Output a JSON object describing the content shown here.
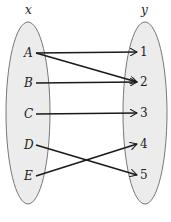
{
  "diagram": {
    "type": "mapping",
    "domain_label": "x",
    "codomain_label": "y",
    "domain": [
      {
        "label": "A",
        "x": 28,
        "y": 53
      },
      {
        "label": "B",
        "x": 28,
        "y": 83
      },
      {
        "label": "C",
        "x": 28,
        "y": 114
      },
      {
        "label": "D",
        "x": 28,
        "y": 145
      },
      {
        "label": "E",
        "x": 28,
        "y": 176
      }
    ],
    "codomain": [
      {
        "label": "1",
        "x": 143,
        "y": 52
      },
      {
        "label": "2",
        "x": 143,
        "y": 82
      },
      {
        "label": "3",
        "x": 143,
        "y": 113
      },
      {
        "label": "4",
        "x": 143,
        "y": 144
      },
      {
        "label": "5",
        "x": 143,
        "y": 175
      }
    ],
    "arrows": [
      {
        "from": "A",
        "to": "1"
      },
      {
        "from": "A",
        "to": "2"
      },
      {
        "from": "B",
        "to": "2"
      },
      {
        "from": "C",
        "to": "3"
      },
      {
        "from": "D",
        "to": "5"
      },
      {
        "from": "E",
        "to": "4"
      }
    ],
    "colors": {
      "ellipse_fill": "#ececec",
      "ellipse_stroke": "#777777",
      "arrow": "#1a1a1a"
    }
  }
}
